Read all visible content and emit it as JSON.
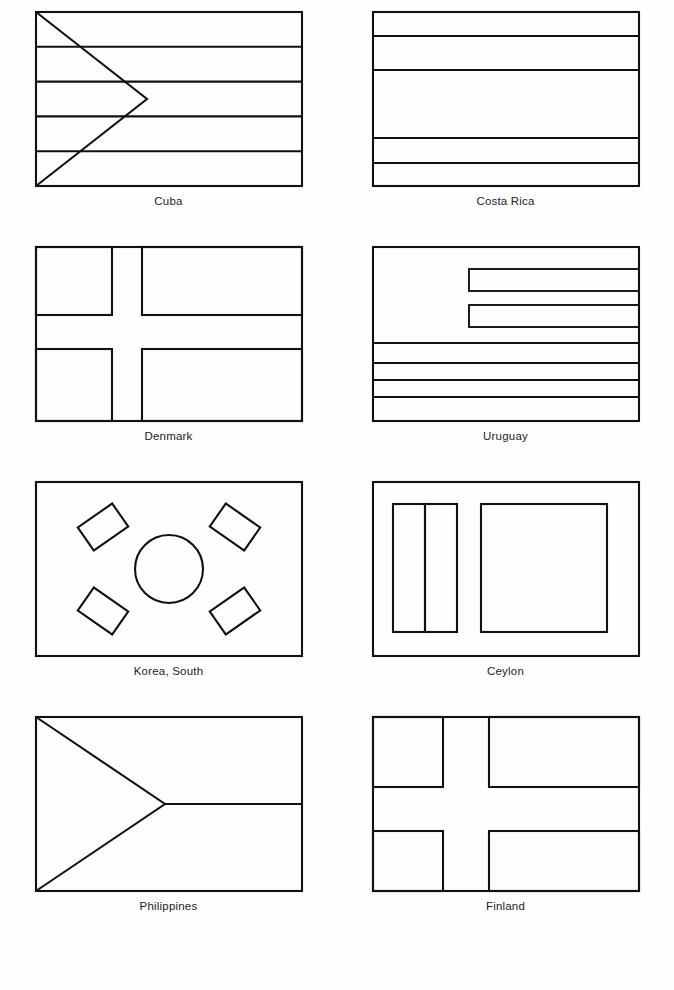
{
  "page": {
    "kind": "flag-reference-chart",
    "background_color": "#fefefe",
    "line_color": "#111111",
    "label_color": "#232323",
    "columns": 2,
    "rows": 4,
    "flag_count": 8
  },
  "flags": [
    {
      "name": "Cuba",
      "label": "Cuba",
      "design": "five horizontal stripes with hoist-side triangle",
      "stripes": 5,
      "shapes": [
        "triangle",
        "horizontal-stripes"
      ]
    },
    {
      "name": "Costa Rica",
      "label": "Costa Rica",
      "design": "five horizontal stripes, wide center band",
      "stripes": 5,
      "shapes": [
        "horizontal-stripes"
      ]
    },
    {
      "name": "Denmark",
      "label": "Denmark",
      "design": "nordic cross offset toward hoist",
      "stripes": 0,
      "shapes": [
        "nordic-cross"
      ]
    },
    {
      "name": "Uruguay",
      "label": "Uruguay",
      "design": "nine stripes with canton at upper hoist",
      "stripes": 9,
      "shapes": [
        "canton",
        "horizontal-stripes"
      ]
    },
    {
      "name": "Korea, South",
      "label": "Korea, South",
      "design": "central circle with four corner trigrams",
      "stripes": 0,
      "shapes": [
        "circle",
        "trigram",
        "trigram",
        "trigram",
        "trigram"
      ]
    },
    {
      "name": "Ceylon",
      "label": "Ceylon",
      "design": "two vertical bands at hoist and large panel with border",
      "stripes": 2,
      "shapes": [
        "vertical-stripes",
        "panel",
        "border"
      ]
    },
    {
      "name": "Philippines",
      "label": "Philippines",
      "design": "hoist triangle with horizontal divider",
      "stripes": 2,
      "shapes": [
        "triangle",
        "horizontal-divider"
      ]
    },
    {
      "name": "Finland",
      "label": "Finland",
      "design": "wide nordic cross offset toward hoist",
      "stripes": 0,
      "shapes": [
        "nordic-cross"
      ]
    }
  ]
}
